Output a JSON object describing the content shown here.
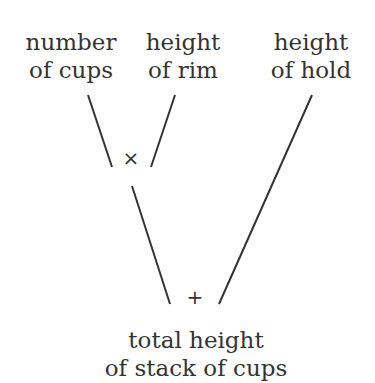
{
  "nodes": {
    "number_of_cups": {
      "line1": "number",
      "line2": "of cups"
    },
    "height_of_rim": {
      "line1": "height",
      "line2": "of rim"
    },
    "height_of_hold": {
      "line1": "height",
      "line2": "of hold"
    },
    "total": {
      "line1": "total height",
      "line2": "of stack of cups"
    }
  },
  "operators": {
    "multiply": "×",
    "add": "+"
  },
  "colors": {
    "ink": "#333333",
    "background": "#ffffff"
  }
}
